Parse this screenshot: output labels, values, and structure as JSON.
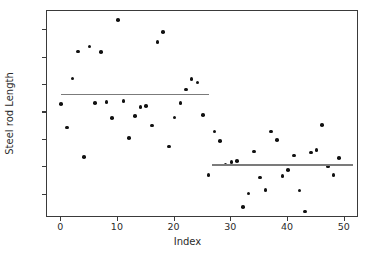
{
  "chart_data": {
    "type": "scatter",
    "title": "",
    "xlabel": "Index",
    "ylabel": "Steel rod Length",
    "xlim": [
      -2.5,
      52.5
    ],
    "ylim": [
      15.15,
      22.7
    ],
    "xticks": [
      0,
      10,
      20,
      30,
      40,
      50
    ],
    "yticks": [
      16,
      17,
      18,
      19,
      20,
      21,
      22
    ],
    "grid": false,
    "legend": null,
    "marker_color": "#111111",
    "line_color": "#7b7b7b",
    "x": [
      0,
      1,
      2,
      3,
      4,
      5,
      6,
      7,
      8,
      9,
      10,
      11,
      12,
      13,
      14,
      15,
      16,
      17,
      18,
      19,
      20,
      21,
      22,
      23,
      24,
      25,
      26,
      27,
      28,
      29,
      30,
      31,
      32,
      33,
      34,
      35,
      36,
      37,
      38,
      39,
      40,
      41,
      42,
      43,
      44,
      45,
      46,
      47,
      48,
      49
    ],
    "y": [
      19.31,
      18.45,
      20.24,
      21.23,
      17.38,
      21.4,
      19.35,
      21.21,
      19.38,
      18.79,
      22.38,
      19.42,
      18.06,
      18.88,
      19.19,
      19.23,
      18.52,
      21.58,
      21.93,
      17.76,
      18.82,
      19.34,
      19.83,
      20.23,
      20.09,
      18.9,
      16.71,
      18.3,
      17.95,
      17.1,
      17.19,
      17.22,
      15.55,
      16.05,
      17.57,
      16.62,
      16.18,
      18.3,
      18.0,
      16.69,
      16.89,
      17.43,
      16.15,
      15.39,
      17.54,
      17.64,
      18.54,
      17.03,
      16.72,
      17.33
    ],
    "segments": [
      {
        "name": "segment-1",
        "x_start": 0,
        "x_end": 26,
        "value": 19.65
      },
      {
        "name": "segment-2",
        "x_start": 26.5,
        "x_end": 51.5,
        "value": 17.09
      }
    ]
  }
}
